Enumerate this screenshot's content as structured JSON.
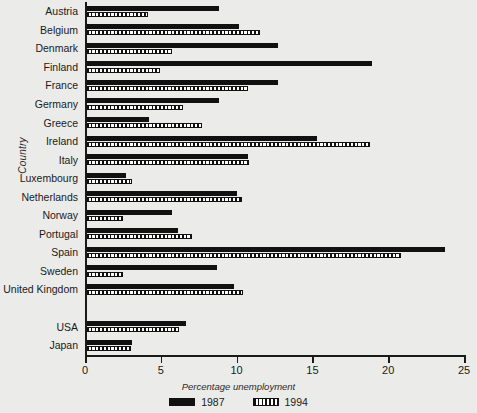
{
  "chart_data": {
    "type": "bar",
    "orientation": "horizontal",
    "title": "",
    "xlabel": "Percentage unemployment",
    "ylabel": "Country",
    "xlim": [
      0,
      25
    ],
    "xticks": [
      0,
      5,
      10,
      15,
      20,
      25
    ],
    "grid": false,
    "legend_position": "bottom",
    "categories": [
      "Austria",
      "Belgium",
      "Denmark",
      "Finland",
      "France",
      "Germany",
      "Greece",
      "Ireland",
      "Italy",
      "Luxembourg",
      "Netherlands",
      "Norway",
      "Portugal",
      "Spain",
      "Sweden",
      "United Kingdom",
      "",
      "USA",
      "Japan"
    ],
    "series": [
      {
        "name": "1987",
        "color": "#111111",
        "values": [
          8.7,
          10.0,
          12.6,
          18.8,
          12.6,
          8.7,
          4.1,
          15.2,
          10.6,
          2.6,
          9.9,
          5.6,
          6.0,
          23.6,
          8.6,
          9.7,
          null,
          6.5,
          3.0
        ]
      },
      {
        "name": "1994",
        "color": "#ffffff",
        "values": [
          4.0,
          11.4,
          5.6,
          4.8,
          10.6,
          6.3,
          7.6,
          18.7,
          10.7,
          3.0,
          10.2,
          2.4,
          6.9,
          20.7,
          2.4,
          10.3,
          null,
          6.1,
          2.9
        ]
      }
    ]
  },
  "legend": {
    "items": [
      {
        "label": "1987",
        "swatch": "solid-black"
      },
      {
        "label": "1994",
        "swatch": "dotted-white"
      }
    ]
  }
}
